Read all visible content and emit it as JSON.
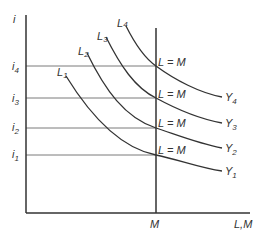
{
  "diagram": {
    "type": "economics-isoquant-diagram",
    "y_axis": {
      "label": "i"
    },
    "x_axis": {
      "label": "L,M",
      "tick_label": "M"
    },
    "interest_levels": [
      {
        "base": "i",
        "sub": "4"
      },
      {
        "base": "i",
        "sub": "3"
      },
      {
        "base": "i",
        "sub": "2"
      },
      {
        "base": "i",
        "sub": "1"
      }
    ],
    "curve_start_labels": [
      {
        "base": "L",
        "sub": "1"
      },
      {
        "base": "L",
        "sub": "2"
      },
      {
        "base": "L",
        "sub": "3"
      },
      {
        "base": "L",
        "sub": "4"
      }
    ],
    "curve_end_labels": [
      {
        "base": "Y",
        "sub": "1"
      },
      {
        "base": "Y",
        "sub": "2"
      },
      {
        "base": "Y",
        "sub": "3"
      },
      {
        "base": "Y",
        "sub": "4"
      }
    ],
    "intersection_labels": [
      "L = M",
      "L = M",
      "L = M",
      "L = M"
    ],
    "colors": {
      "line": "#333333",
      "guide": "#777777"
    }
  }
}
